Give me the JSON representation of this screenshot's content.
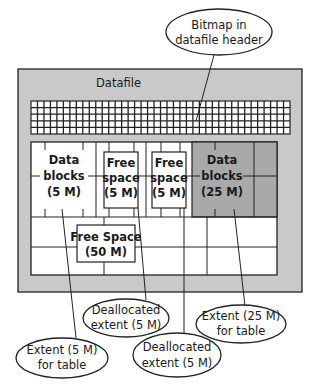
{
  "diagram": {
    "datafile_label": "Datafile",
    "bitmap": {
      "columns": 40,
      "rows": 5
    },
    "segments": [
      {
        "id": "data-5m",
        "lines": [
          "Data",
          "blocks",
          "(5 M)"
        ],
        "fill": "#ffffff"
      },
      {
        "id": "free-5m-a",
        "lines": [
          "Free",
          "space",
          "(5 M)"
        ],
        "fill": "#ffffff"
      },
      {
        "id": "free-5m-b",
        "lines": [
          "Free",
          "space",
          "(5 M)"
        ],
        "fill": "#ffffff"
      },
      {
        "id": "data-25m",
        "lines": [
          "Data",
          "blocks",
          "(25 M)"
        ],
        "fill": "#a9a9a9"
      }
    ],
    "free_space_large": {
      "lines": [
        "Free Space",
        "(50 M)"
      ]
    },
    "callouts": {
      "bitmap": {
        "lines": [
          "Bitmap in",
          "datafile header"
        ]
      },
      "dealloc_a": {
        "lines": [
          "Deallocated",
          "extent (5 M)"
        ]
      },
      "extent_25": {
        "lines": [
          "Extent (25 M)",
          "for table"
        ]
      },
      "extent_5": {
        "lines": [
          "Extent (5 M)",
          "for table"
        ]
      },
      "dealloc_b": {
        "lines": [
          "Deallocated",
          "extent (5 M)"
        ]
      }
    },
    "colors": {
      "datafile_fill": "#c9c9c9",
      "dark_extent_fill": "#a9a9a9",
      "stroke": "#222222",
      "white": "#ffffff"
    }
  }
}
